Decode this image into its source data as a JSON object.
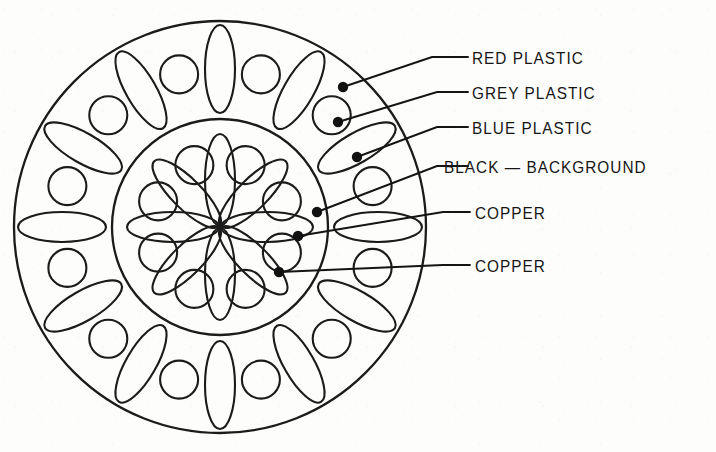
{
  "figure": {
    "type": "annotated-cross-section",
    "background_color": "#fdfdfc",
    "line_color": "#1b1b1b",
    "title": ""
  },
  "geometry": {
    "center_x": 220,
    "center_y": 227,
    "outer_circle_radius": 206,
    "inner_circle_radius": 108,
    "outer_ring": {
      "element_count": 24,
      "ellipse_count": 12,
      "circle_count": 12,
      "angle_step_deg": 15,
      "ellipse_center_radius": 158,
      "ellipse_semi_major": 44,
      "ellipse_semi_minor": 15,
      "circle_center_radius": 158,
      "circle_radius": 19
    },
    "inner_ring": {
      "petal_count": 8,
      "circle_count": 8,
      "angle_step_deg": 45,
      "petal_center_radius": 47,
      "petal_semi_major": 46,
      "petal_semi_minor": 15,
      "circle_center_radius": 67,
      "circle_radius": 19
    }
  },
  "callouts": [
    {
      "id": "red-plastic",
      "label": "RED PLASTIC",
      "dot_x": 343,
      "dot_y": 87,
      "elbow_x": 432,
      "elbow_y": 57,
      "line_end_x": 468,
      "line_end_y": 57,
      "label_x": 472,
      "label_y": 50,
      "target_region": "outer-ring-background"
    },
    {
      "id": "grey-plastic",
      "label": "GREY PLASTIC",
      "dot_x": 338,
      "dot_y": 122,
      "elbow_x": 437,
      "elbow_y": 92,
      "line_end_x": 468,
      "line_end_y": 92,
      "label_x": 472,
      "label_y": 85,
      "target_region": "outer-ring-circle"
    },
    {
      "id": "blue-plastic",
      "label": "BLUE PLASTIC",
      "dot_x": 357,
      "dot_y": 157,
      "elbow_x": 437,
      "elbow_y": 127,
      "line_end_x": 468,
      "line_end_y": 127,
      "label_x": 472,
      "label_y": 120,
      "target_region": "outer-ring-ellipse"
    },
    {
      "id": "black-background",
      "label": "BLACK  —  BACKGROUND",
      "dot_x": 317,
      "dot_y": 212,
      "elbow_x": 437,
      "elbow_y": 166,
      "line_end_x": 468,
      "line_end_y": 166,
      "label_x": 444,
      "label_y": 159,
      "target_region": "inner-zone-background"
    },
    {
      "id": "copper-upper",
      "label": "COPPER",
      "dot_x": 298,
      "dot_y": 236,
      "elbow_x": 443,
      "elbow_y": 212,
      "line_end_x": 470,
      "line_end_y": 212,
      "label_x": 475,
      "label_y": 205,
      "target_region": "inner-ring-circle"
    },
    {
      "id": "copper-lower",
      "label": "COPPER",
      "dot_x": 279,
      "dot_y": 272,
      "elbow_x": 443,
      "elbow_y": 265,
      "line_end_x": 470,
      "line_end_y": 265,
      "label_x": 475,
      "label_y": 258,
      "target_region": "inner-ring-petal"
    }
  ]
}
